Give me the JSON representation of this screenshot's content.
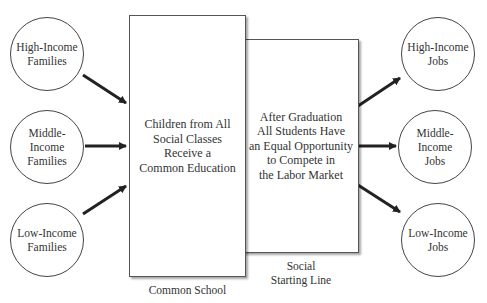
{
  "diagram": {
    "sources": [
      {
        "label": "High-Income\nFamilies"
      },
      {
        "label": "Middle-\nIncome\nFamilies"
      },
      {
        "label": "Low-Income\nFamilies"
      }
    ],
    "common_school_box": {
      "text": "Children from All\nSocial Classes\nReceive a\nCommon Education",
      "caption": "Common School"
    },
    "starting_line_box": {
      "text": "After Graduation\nAll Students Have\nan Equal Opportunity\nto Compete in\nthe Labor Market",
      "caption": "Social\nStarting Line"
    },
    "outcomes": [
      {
        "label": "High-Income\nJobs"
      },
      {
        "label": "Middle-\nIncome\nJobs"
      },
      {
        "label": "Low-Income\nJobs"
      }
    ],
    "colors": {
      "stroke": "#444444",
      "arrow": "#222222",
      "background": "#ffffff"
    }
  }
}
